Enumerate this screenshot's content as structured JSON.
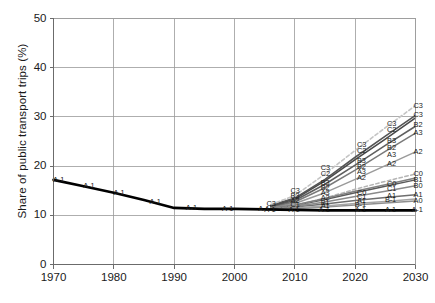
{
  "chart_data": {
    "type": "line",
    "title": "",
    "xlabel": "",
    "ylabel": "Share of public transport trips (%)",
    "xlim": [
      1970,
      2030
    ],
    "ylim": [
      0,
      50
    ],
    "xticks": [
      1970,
      1980,
      1990,
      2000,
      2010,
      2020,
      2030
    ],
    "yticks": [
      0,
      10,
      20,
      30,
      40,
      50
    ],
    "grid": true,
    "legend_position": "inline-labels",
    "series": [
      {
        "name": "A-1",
        "style": "solid",
        "color": "#000000",
        "width": 2.6,
        "x": [
          1970,
          1975,
          1980,
          1985,
          1990,
          1995,
          2000,
          2005,
          2010,
          2015,
          2020,
          2025,
          2030
        ],
        "values": [
          17.2,
          15.9,
          14.6,
          13.1,
          11.5,
          11.3,
          11.3,
          11.2,
          11.1,
          11.0,
          11.0,
          11.0,
          11.0
        ]
      },
      {
        "name": "A0",
        "style": "solid",
        "color": "#8f8f8f",
        "width": 1.5,
        "x": [
          2006,
          2010,
          2015,
          2020,
          2025,
          2030
        ],
        "values": [
          11.3,
          11.4,
          11.7,
          12.1,
          12.5,
          12.9
        ]
      },
      {
        "name": "A1",
        "style": "solid",
        "color": "#6e6e6e",
        "width": 1.5,
        "x": [
          2006,
          2010,
          2015,
          2020,
          2025,
          2030
        ],
        "values": [
          11.4,
          11.7,
          12.3,
          13.0,
          13.6,
          14.2
        ]
      },
      {
        "name": "A2",
        "style": "solid",
        "color": "#9a9a9a",
        "width": 1.5,
        "x": [
          2006,
          2010,
          2015,
          2020,
          2025,
          2030
        ],
        "values": [
          11.6,
          12.4,
          14.6,
          17.3,
          20.1,
          22.9
        ]
      },
      {
        "name": "A3",
        "style": "solid",
        "color": "#7a7a7a",
        "width": 1.5,
        "x": [
          2006,
          2010,
          2015,
          2020,
          2025,
          2030
        ],
        "values": [
          11.7,
          12.7,
          15.6,
          19.2,
          23.0,
          26.7
        ]
      },
      {
        "name": "B-1",
        "style": "solid",
        "color": "#a5a5a5",
        "width": 1.5,
        "x": [
          2006,
          2010,
          2015,
          2020,
          2025,
          2030
        ],
        "values": [
          11.3,
          11.5,
          11.9,
          12.4,
          12.8,
          13.3
        ]
      },
      {
        "name": "B0",
        "style": "solid",
        "color": "#8a8a8a",
        "width": 1.5,
        "x": [
          2006,
          2010,
          2015,
          2020,
          2025,
          2030
        ],
        "values": [
          11.4,
          11.8,
          12.7,
          13.8,
          14.9,
          16.0
        ]
      },
      {
        "name": "B1",
        "style": "solid",
        "color": "#5a5a5a",
        "width": 1.5,
        "x": [
          2006,
          2010,
          2015,
          2020,
          2025,
          2030
        ],
        "values": [
          11.5,
          12.0,
          13.2,
          14.6,
          15.9,
          17.2
        ]
      },
      {
        "name": "B2",
        "style": "solid",
        "color": "#5f5f5f",
        "width": 1.6,
        "x": [
          2006,
          2010,
          2015,
          2020,
          2025,
          2030
        ],
        "values": [
          11.8,
          13.0,
          16.3,
          20.2,
          24.2,
          28.1
        ]
      },
      {
        "name": "B3",
        "style": "solid",
        "color": "#4a4a4a",
        "width": 1.6,
        "x": [
          2006,
          2010,
          2015,
          2020,
          2025,
          2030
        ],
        "values": [
          11.9,
          13.3,
          17.0,
          21.3,
          25.5,
          29.8
        ]
      },
      {
        "name": "C0",
        "style": "dashed",
        "color": "#b5b5b5",
        "width": 1.5,
        "x": [
          2006,
          2010,
          2015,
          2020,
          2025,
          2030
        ],
        "values": [
          11.5,
          12.0,
          13.5,
          15.3,
          16.9,
          18.4
        ]
      },
      {
        "name": "C1",
        "style": "solid",
        "color": "#7f7f7f",
        "width": 1.5,
        "x": [
          2006,
          2010,
          2015,
          2020,
          2025,
          2030
        ],
        "values": [
          11.5,
          12.1,
          13.4,
          14.9,
          16.2,
          17.6
        ]
      },
      {
        "name": "C2",
        "style": "solid",
        "color": "#555555",
        "width": 1.6,
        "x": [
          2006,
          2010,
          2015,
          2020,
          2025,
          2030
        ],
        "values": [
          12.0,
          13.5,
          17.3,
          21.8,
          26.1,
          30.3
        ]
      },
      {
        "name": "C3",
        "style": "dashed",
        "color": "#c4c4c4",
        "width": 1.6,
        "x": [
          2006,
          2010,
          2015,
          2020,
          2025,
          2030
        ],
        "values": [
          12.2,
          14.0,
          18.4,
          23.2,
          27.8,
          32.3
        ]
      }
    ],
    "inline_labels": [
      {
        "text": "A-1",
        "x": 1971,
        "y": 17.2
      },
      {
        "text": "A-1",
        "x": 1976,
        "y": 15.9
      },
      {
        "text": "A-1",
        "x": 1981,
        "y": 14.6
      },
      {
        "text": "A-1",
        "x": 1987,
        "y": 12.8
      },
      {
        "text": "A-1",
        "x": 1993,
        "y": 11.4
      },
      {
        "text": "A-1",
        "x": 1999,
        "y": 11.3
      },
      {
        "text": "A-1",
        "x": 2005,
        "y": 11.2
      },
      {
        "text": "C3",
        "x": 2006,
        "y": 12.3
      },
      {
        "text": "A-1",
        "x": 2006,
        "y": 11.1
      },
      {
        "text": "C3",
        "x": 2010,
        "y": 15.0
      },
      {
        "text": "B3",
        "x": 2010,
        "y": 14.0
      },
      {
        "text": "A2",
        "x": 2010,
        "y": 12.9
      },
      {
        "text": "C1",
        "x": 2010,
        "y": 12.1
      },
      {
        "text": "A-1",
        "x": 2010,
        "y": 11.1
      },
      {
        "text": "C3",
        "x": 2015,
        "y": 19.6
      },
      {
        "text": "C2",
        "x": 2015,
        "y": 18.4
      },
      {
        "text": "B3",
        "x": 2015,
        "y": 16.5
      },
      {
        "text": "B2",
        "x": 2015,
        "y": 15.5
      },
      {
        "text": "A3",
        "x": 2015,
        "y": 14.6
      },
      {
        "text": "A2",
        "x": 2015,
        "y": 13.6
      },
      {
        "text": "B1",
        "x": 2015,
        "y": 12.6
      },
      {
        "text": "A1",
        "x": 2015,
        "y": 11.9
      },
      {
        "text": "A-1",
        "x": 2015,
        "y": 11.1
      },
      {
        "text": "C3",
        "x": 2021,
        "y": 24.3
      },
      {
        "text": "C2",
        "x": 2021,
        "y": 23.1
      },
      {
        "text": "B3",
        "x": 2021,
        "y": 21.0
      },
      {
        "text": "B2",
        "x": 2021,
        "y": 19.8
      },
      {
        "text": "A3",
        "x": 2021,
        "y": 18.7
      },
      {
        "text": "A2",
        "x": 2021,
        "y": 17.5
      },
      {
        "text": "C0",
        "x": 2021,
        "y": 14.6
      },
      {
        "text": "C1",
        "x": 2021,
        "y": 13.8
      },
      {
        "text": "A1",
        "x": 2021,
        "y": 12.9
      },
      {
        "text": "B-1",
        "x": 2021,
        "y": 12.1
      },
      {
        "text": "A-1",
        "x": 2021,
        "y": 11.1
      },
      {
        "text": "C3",
        "x": 2026,
        "y": 28.6
      },
      {
        "text": "C2",
        "x": 2026,
        "y": 27.4
      },
      {
        "text": "B3",
        "x": 2026,
        "y": 25.2
      },
      {
        "text": "B2",
        "x": 2026,
        "y": 23.6
      },
      {
        "text": "A3",
        "x": 2026,
        "y": 22.2
      },
      {
        "text": "A2",
        "x": 2026,
        "y": 20.4
      },
      {
        "text": "C0",
        "x": 2026,
        "y": 16.4
      },
      {
        "text": "C1",
        "x": 2026,
        "y": 15.3
      },
      {
        "text": "A1",
        "x": 2026,
        "y": 14.0
      },
      {
        "text": "B-1",
        "x": 2026,
        "y": 13.1
      },
      {
        "text": "A-1",
        "x": 2026,
        "y": 11.1
      },
      {
        "text": "C3",
        "x": 2030.4,
        "y": 32.3
      },
      {
        "text": "C3",
        "x": 2030.4,
        "y": 30.3
      },
      {
        "text": "B2",
        "x": 2030.4,
        "y": 28.3
      },
      {
        "text": "A3",
        "x": 2030.4,
        "y": 26.8
      },
      {
        "text": "A2",
        "x": 2030.4,
        "y": 22.9
      },
      {
        "text": "C0",
        "x": 2030.4,
        "y": 18.4
      },
      {
        "text": "B1",
        "x": 2030.4,
        "y": 17.2
      },
      {
        "text": "B0",
        "x": 2030.4,
        "y": 16.0
      },
      {
        "text": "A1",
        "x": 2030.4,
        "y": 14.2
      },
      {
        "text": "A0",
        "x": 2030.4,
        "y": 12.9
      },
      {
        "text": "A-1",
        "x": 2030.4,
        "y": 11.0
      }
    ]
  },
  "axes": {
    "y_title": "Share of public transport trips (%)",
    "y_tick_labels": [
      "0",
      "10",
      "20",
      "30",
      "40",
      "50"
    ],
    "x_tick_labels": [
      "1970",
      "1980",
      "1990",
      "2000",
      "2010",
      "2020",
      "2030"
    ]
  },
  "colors": {
    "axis": "#6b6b6b",
    "grid": "#9a9a9a",
    "text": "#1a1a1a",
    "historical_line": "#000000"
  }
}
